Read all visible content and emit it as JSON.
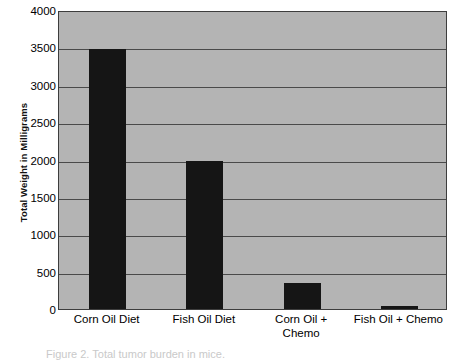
{
  "chart_data": {
    "type": "bar",
    "title": "",
    "xlabel": "",
    "ylabel": "Total Weight in Milligrams",
    "categories": [
      "Corn Oil Diet",
      "Fish Oil Diet",
      "Corn Oil +\nChemo",
      "Fish Oil + Chemo"
    ],
    "values": [
      3480,
      1980,
      350,
      40
    ],
    "ylim": [
      0,
      4000
    ],
    "ytick_labels": [
      "4000",
      "3500",
      "3000",
      "2500",
      "2000",
      "1500",
      "1000",
      "500",
      "0"
    ],
    "ytick_values": [
      4000,
      3500,
      3000,
      2500,
      2000,
      1500,
      1000,
      500,
      0
    ],
    "grid": true,
    "legend": null,
    "series": [
      {
        "name": "Total Weight in Milligrams",
        "values": [
          3480,
          1980,
          350,
          40
        ]
      }
    ],
    "colors": {
      "bar": "#151515",
      "plot_background": "#b4b4b4",
      "gridline": "#4a4a4a",
      "axis_border": "#3d3d3d",
      "figure_background": "#ffffff",
      "text": "#000000"
    }
  },
  "axis": {
    "y_title": "Total Weight in Milligrams"
  },
  "caption": {
    "text": "Figure 2. Total tumor burden in mice."
  }
}
